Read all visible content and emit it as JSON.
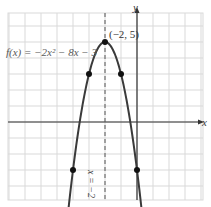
{
  "chart_data": {
    "type": "line",
    "title": "",
    "function_label": "f(x) = −2x² − 8x − 3",
    "xlabel": "x",
    "ylabel": "y",
    "xlim": [
      -8,
      4
    ],
    "ylim": [
      -5,
      7
    ],
    "grid": true,
    "axis_of_symmetry": {
      "label": "x = −2",
      "x": -2,
      "style": "dashed"
    },
    "vertex": {
      "x": -2,
      "y": 5,
      "label": "(−2, 5)"
    },
    "points": [
      {
        "x": -4,
        "y": -3
      },
      {
        "x": -3,
        "y": 3
      },
      {
        "x": -2,
        "y": 5
      },
      {
        "x": -1,
        "y": 3
      },
      {
        "x": 0,
        "y": -3
      }
    ],
    "series": [
      {
        "name": "f(x) = −2x² − 8x − 3",
        "coefficients": {
          "a": -2,
          "b": -8,
          "c": -3
        }
      }
    ]
  },
  "labels": {
    "func": "f(x) = −2x² − 8x − 3",
    "vertex": "(−2, 5)",
    "y_axis": "y",
    "x_axis": "x",
    "symmetry": "x = −2"
  },
  "colors": {
    "grid": "#d9d9d9",
    "axis": "#333333",
    "curve": "#3a3a3a",
    "points": "#111111"
  }
}
